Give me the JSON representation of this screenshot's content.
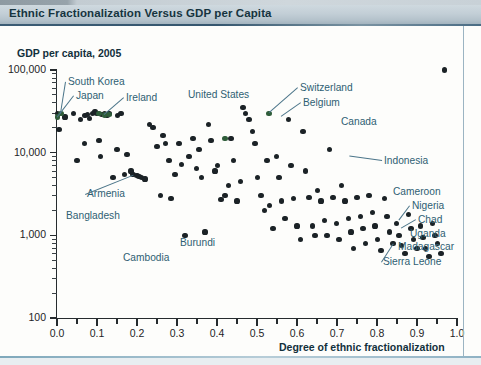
{
  "header": {
    "title": "Ethnic Fractionalization Versus GDP per Capita",
    "accent_color": "#35566e",
    "bar_color": "#c2ced6"
  },
  "chart_data": {
    "type": "scatter",
    "title": "Ethnic Fractionalization Versus GDP per Capita",
    "subtitle": "GDP per capita, 2005",
    "xlabel": "Degree of ethnic fractionalization",
    "ylabel": "GDP per capita, 2005",
    "yscale": "log",
    "ylim": [
      100,
      100000
    ],
    "xlim": [
      0.0,
      1.0
    ],
    "grid": false,
    "legend": "none",
    "point_color": "#1b2226",
    "highlight_color": "#2f5d3a",
    "annotation_color": "#2f5f73",
    "yticks": [
      "100",
      "1,000",
      "10,000",
      "100,000"
    ],
    "ytick_values": [
      100,
      1000,
      10000,
      100000
    ],
    "xticks": [
      "0.0",
      "0.1",
      "0.2",
      "0.3",
      "0.4",
      "0.5",
      "0.6",
      "0.7",
      "0.8",
      "0.9",
      "1.0"
    ],
    "xtick_values": [
      0.0,
      0.1,
      0.2,
      0.3,
      0.4,
      0.5,
      0.6,
      0.7,
      0.8,
      0.9,
      1.0
    ],
    "x": [
      0.002,
      0.02,
      0.005,
      0.041,
      0.05,
      0.058,
      0.068,
      0.07,
      0.076,
      0.082,
      0.088,
      0.095,
      0.1,
      0.105,
      0.108,
      0.112,
      0.118,
      0.125,
      0.13,
      0.14,
      0.15,
      0.152,
      0.16,
      0.168,
      0.175,
      0.185,
      0.19,
      0.2,
      0.205,
      0.212,
      0.22,
      0.232,
      0.24,
      0.25,
      0.258,
      0.265,
      0.272,
      0.28,
      0.285,
      0.295,
      0.305,
      0.312,
      0.32,
      0.33,
      0.34,
      0.348,
      0.355,
      0.362,
      0.37,
      0.378,
      0.385,
      0.395,
      0.402,
      0.41,
      0.42,
      0.428,
      0.435,
      0.442,
      0.45,
      0.458,
      0.465,
      0.472,
      0.48,
      0.488,
      0.495,
      0.502,
      0.51,
      0.518,
      0.525,
      0.532,
      0.54,
      0.548,
      0.555,
      0.562,
      0.57,
      0.578,
      0.585,
      0.592,
      0.6,
      0.608,
      0.615,
      0.622,
      0.63,
      0.638,
      0.645,
      0.652,
      0.66,
      0.668,
      0.675,
      0.682,
      0.69,
      0.698,
      0.705,
      0.712,
      0.72,
      0.728,
      0.735,
      0.742,
      0.75,
      0.758,
      0.765,
      0.772,
      0.78,
      0.788,
      0.795,
      0.802,
      0.81,
      0.818,
      0.825,
      0.832,
      0.84,
      0.848,
      0.855,
      0.862,
      0.87,
      0.878,
      0.885,
      0.892,
      0.9,
      0.908,
      0.915,
      0.922,
      0.93,
      0.938,
      0.945,
      0.952,
      0.96,
      0.968
    ],
    "y": [
      30000,
      27000,
      19000,
      30000,
      8000,
      25000,
      13000,
      28000,
      29000,
      26000,
      30000,
      31000,
      30000,
      14000,
      9000,
      29000,
      30000,
      28000,
      30000,
      5000,
      11000,
      28000,
      30000,
      5500,
      9500,
      6000,
      5400,
      5300,
      5200,
      5000,
      4800,
      22000,
      20000,
      12000,
      3000,
      16000,
      13000,
      8000,
      2800,
      5500,
      13000,
      7200,
      1000,
      9000,
      15000,
      6500,
      11000,
      5000,
      1100,
      22000,
      14000,
      6000,
      7000,
      2700,
      3000,
      4000,
      15000,
      8000,
      2600,
      4500,
      35000,
      30000,
      25000,
      18000,
      13000,
      5000,
      3000,
      2000,
      8000,
      2300,
      1200,
      9000,
      5000,
      2600,
      1600,
      25000,
      7000,
      2800,
      1300,
      900,
      18000,
      6000,
      2900,
      1300,
      1000,
      3500,
      2600,
      1500,
      1000,
      11000,
      2900,
      1400,
      900,
      4000,
      2600,
      1600,
      1100,
      700,
      2900,
      1700,
      1200,
      800,
      3000,
      1900,
      1300,
      900,
      650,
      2800,
      1700,
      1100,
      800,
      1400,
      1000,
      750,
      600,
      1800,
      1200,
      900,
      700,
      1300,
      950,
      700,
      550,
      1400,
      1000,
      800,
      600
    ],
    "annotations": [
      {
        "label": "South Korea",
        "x": 68,
        "y": 76,
        "leader": true,
        "px": 0.01,
        "py": 30000
      },
      {
        "label": "Japan",
        "x": 76,
        "y": 90,
        "leader": true,
        "px": 0.002,
        "py": 27000
      },
      {
        "label": "Ireland",
        "x": 126,
        "y": 92,
        "leader": true,
        "px": 0.118,
        "py": 28500
      },
      {
        "label": "United States",
        "x": 188,
        "y": 89,
        "leader": false,
        "px": 0.42,
        "py": 15000
      },
      {
        "label": "Switzerland",
        "x": 300,
        "y": 82,
        "leader": true,
        "px": 0.53,
        "py": 30000
      },
      {
        "label": "Belgium",
        "x": 303,
        "y": 97,
        "leader": true,
        "px": 0.56,
        "py": 27000
      },
      {
        "label": "Canada",
        "x": 341,
        "y": 116,
        "leader": false,
        "px": 0.71,
        "py": 22000
      },
      {
        "label": "Indonesia",
        "x": 384,
        "y": 155,
        "leader": true,
        "px": 0.73,
        "py": 9000
      },
      {
        "label": "Armenia",
        "x": 87,
        "y": 188,
        "leader": true,
        "px": 0.19,
        "py": 5400
      },
      {
        "label": "Bangladesh",
        "x": 66,
        "y": 210,
        "leader": false,
        "px": 0.047,
        "py": 2000
      },
      {
        "label": "Burundi",
        "x": 180,
        "y": 237,
        "leader": false,
        "px": 0.295,
        "py": 1150
      },
      {
        "label": "Cambodia",
        "x": 123,
        "y": 252,
        "leader": false,
        "px": 0.215,
        "py": 1200
      },
      {
        "label": "Cameroon",
        "x": 393,
        "y": 186,
        "leader": false,
        "px": 0.862,
        "py": 2500
      },
      {
        "label": "Nigeria",
        "x": 412,
        "y": 200,
        "leader": true,
        "px": 0.855,
        "py": 1500
      },
      {
        "label": "Chad",
        "x": 418,
        "y": 214,
        "leader": true,
        "px": 0.86,
        "py": 1200
      },
      {
        "label": "Uganda",
        "x": 410,
        "y": 228,
        "leader": false,
        "px": 0.92,
        "py": 1200
      },
      {
        "label": "Madagascar",
        "x": 398,
        "y": 241,
        "leader": false,
        "px": 0.9,
        "py": 950
      },
      {
        "label": "Sierra Leone",
        "x": 383,
        "y": 256,
        "leader": true,
        "px": 0.84,
        "py": 800
      }
    ],
    "highlight_points": [
      {
        "x": 0.01,
        "y": 30000
      },
      {
        "x": 0.002,
        "y": 27000
      },
      {
        "x": 0.118,
        "y": 28500
      },
      {
        "x": 0.13,
        "y": 29000
      },
      {
        "x": 0.105,
        "y": 29500
      },
      {
        "x": 0.42,
        "y": 15000
      },
      {
        "x": 0.53,
        "y": 30000
      }
    ]
  }
}
